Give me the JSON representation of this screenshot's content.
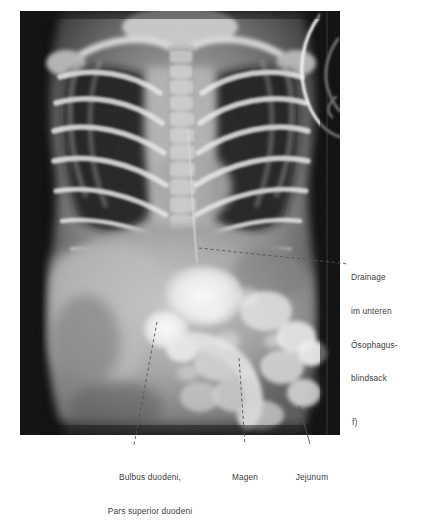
{
  "figure": {
    "letter": "f)",
    "modality": "radiograph"
  },
  "annotations": [
    {
      "id": "drainage",
      "name": "annotation-drainage",
      "position": "right",
      "lines": [
        "Drainage",
        "im unteren",
        "Ösophagus-",
        "blindsack"
      ],
      "leader": {
        "style": "dashed",
        "from_x": 199,
        "from_y": 248,
        "to_x": 348,
        "to_y": 264
      }
    },
    {
      "id": "bulbus",
      "name": "annotation-bulbus-duodeni",
      "position": "below",
      "lines": [
        "Bulbus duodeni,",
        "Pars superior duodeni"
      ],
      "leader": {
        "style": "dashed",
        "from_x": 157,
        "from_y": 322,
        "to_x": 134,
        "to_y": 445
      }
    },
    {
      "id": "magen",
      "name": "annotation-magen",
      "position": "below",
      "lines": [
        "Magen"
      ],
      "leader": {
        "style": "dashed",
        "from_x": 239,
        "from_y": 358,
        "to_x": 245,
        "to_y": 445
      }
    },
    {
      "id": "jejunum",
      "name": "annotation-jejunum",
      "position": "below",
      "lines": [
        "Jejunum"
      ],
      "leader": {
        "style": "solid",
        "from_x": 299,
        "from_y": 406,
        "to_x": 310,
        "to_y": 444
      }
    }
  ],
  "colors": {
    "background": "#ffffff",
    "text": "#3b3b3b",
    "leader_line": "#555555",
    "plate_dark": "#0a0a0a",
    "plate_mid": "#8f8f8f",
    "plate_bright": "#f2f2f2"
  }
}
